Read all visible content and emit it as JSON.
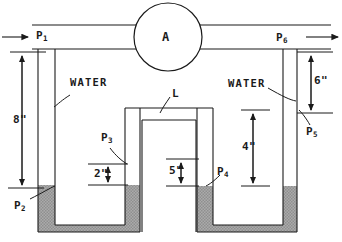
{
  "diagram": {
    "device_label": "A",
    "tube_label": "L",
    "fluid_labels": [
      {
        "name": "water-left",
        "text": "WATER"
      },
      {
        "name": "water-right",
        "text": "WATER"
      }
    ],
    "pressure_points": [
      {
        "name": "p1",
        "base": "P",
        "sub": "1"
      },
      {
        "name": "p2",
        "base": "P",
        "sub": "2"
      },
      {
        "name": "p3",
        "base": "P",
        "sub": "3"
      },
      {
        "name": "p4",
        "base": "P",
        "sub": "4"
      },
      {
        "name": "p5",
        "base": "P",
        "sub": "5"
      },
      {
        "name": "p6",
        "base": "P",
        "sub": "6"
      }
    ],
    "dimensions": [
      {
        "name": "dim-8in",
        "text": "8\""
      },
      {
        "name": "dim-2in",
        "text": "2\""
      },
      {
        "name": "dim-5in",
        "text": "5\""
      },
      {
        "name": "dim-4in",
        "text": "4\""
      },
      {
        "name": "dim-6in",
        "text": "6\""
      }
    ],
    "colors": {
      "line": "#1a1a1a",
      "mercury_fill": "#a8a8a8",
      "background": "#ffffff"
    }
  }
}
